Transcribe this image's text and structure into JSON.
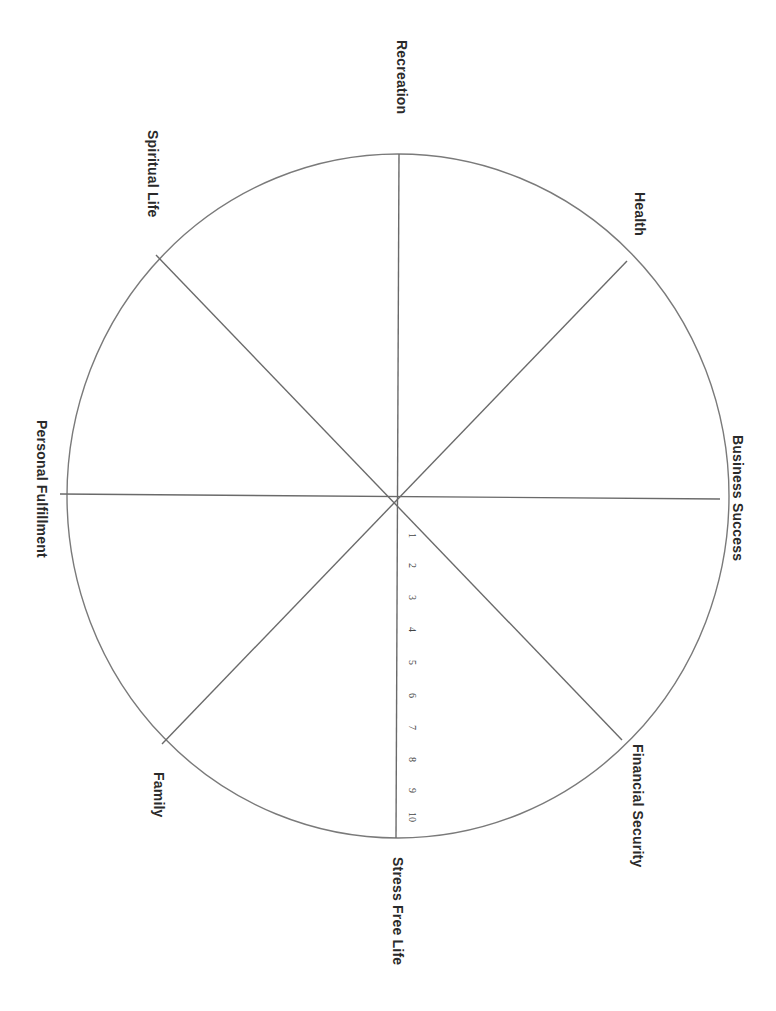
{
  "diagram": {
    "orientation": "rotated 90 degrees clockwise",
    "colors": {
      "line": "#6a6a6a",
      "text": "#2a2a2a",
      "background": "#ffffff"
    },
    "segments": [
      {
        "label": "Recreation"
      },
      {
        "label": "Health"
      },
      {
        "label": "Business Success"
      },
      {
        "label": "Financial Security"
      },
      {
        "label": "Stress Free Life"
      },
      {
        "label": "Family"
      },
      {
        "label": "Personal Fulfillment"
      },
      {
        "label": "Spiritual Life"
      }
    ],
    "scale": {
      "min": 1,
      "max": 10,
      "ticks": [
        "1",
        "2",
        "3",
        "4",
        "5",
        "6",
        "7",
        "8",
        "9",
        "10"
      ]
    }
  }
}
